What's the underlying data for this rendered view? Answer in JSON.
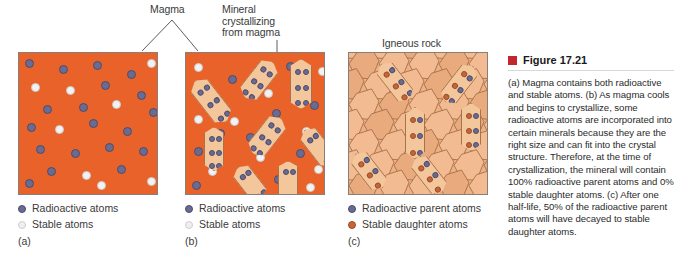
{
  "figure": {
    "marker_color": "#c1272d",
    "heading": "Figure 17.21",
    "caption": "(a) Magma contains both radioactive and stable atoms. (b) As magma cools and begins to crystallize, some radioactive atoms are incorporated into certain minerals because they are the right size and can fit into the crystal structure. Therefore, at the time of crystallization, the mineral will contain 100% radioactive parent atoms and 0% stable daughter atoms. (c) After one half-life, 50% of the radioactive parent atoms will have decayed to stable daughter atoms."
  },
  "callouts": {
    "magma": "Magma",
    "mineral": "Mineral\ncrystallizing\nfrom magma",
    "igneous": "Igneous rock"
  },
  "colors": {
    "magma_fill": "#e8622a",
    "rock_fill": "#efb184",
    "crystal_fill": "#f4c69c",
    "radioactive": "#6b6b8f",
    "stable": "#f2f2f2",
    "daughter": "#c4653a",
    "panel_border": "#8a7f78"
  },
  "panels": [
    {
      "id": "a",
      "tag": "(a)",
      "legend": [
        {
          "icon": "radioactive-atom-swatch",
          "label": "Radioactive atoms",
          "type": "radio"
        },
        {
          "icon": "stable-atom-swatch",
          "label": "Stable atoms",
          "type": "stable"
        }
      ],
      "atoms": [
        {
          "x": 6,
          "y": 6,
          "t": "radio"
        },
        {
          "x": 40,
          "y": 12,
          "t": "radio"
        },
        {
          "x": 74,
          "y": 8,
          "t": "radio"
        },
        {
          "x": 108,
          "y": 17,
          "t": "radio"
        },
        {
          "x": 128,
          "y": 6,
          "t": "stable"
        },
        {
          "x": 12,
          "y": 30,
          "t": "stable"
        },
        {
          "x": 47,
          "y": 33,
          "t": "stable"
        },
        {
          "x": 82,
          "y": 28,
          "t": "radio"
        },
        {
          "x": 118,
          "y": 38,
          "t": "radio"
        },
        {
          "x": 24,
          "y": 52,
          "t": "radio"
        },
        {
          "x": 60,
          "y": 50,
          "t": "radio"
        },
        {
          "x": 93,
          "y": 47,
          "t": "stable"
        },
        {
          "x": 130,
          "y": 55,
          "t": "radio"
        },
        {
          "x": 8,
          "y": 70,
          "t": "radio"
        },
        {
          "x": 36,
          "y": 72,
          "t": "stable"
        },
        {
          "x": 70,
          "y": 66,
          "t": "radio"
        },
        {
          "x": 104,
          "y": 74,
          "t": "radio"
        },
        {
          "x": 17,
          "y": 92,
          "t": "radio"
        },
        {
          "x": 52,
          "y": 96,
          "t": "radio"
        },
        {
          "x": 86,
          "y": 90,
          "t": "radio"
        },
        {
          "x": 120,
          "y": 94,
          "t": "radio"
        },
        {
          "x": 28,
          "y": 114,
          "t": "radio"
        },
        {
          "x": 63,
          "y": 118,
          "t": "stable"
        },
        {
          "x": 98,
          "y": 112,
          "t": "radio"
        },
        {
          "x": 128,
          "y": 124,
          "t": "stable"
        },
        {
          "x": 6,
          "y": 126,
          "t": "radio"
        },
        {
          "x": 78,
          "y": 128,
          "t": "stable"
        }
      ],
      "crystals": []
    },
    {
      "id": "b",
      "tag": "(b)",
      "legend": [
        {
          "icon": "radioactive-atom-swatch",
          "label": "Radioactive atoms",
          "type": "radio"
        },
        {
          "icon": "stable-atom-swatch",
          "label": "Stable atoms",
          "type": "stable"
        }
      ],
      "atoms": [
        {
          "x": 8,
          "y": 10,
          "t": "stable"
        },
        {
          "x": 42,
          "y": 22,
          "t": "radio"
        },
        {
          "x": 100,
          "y": 9,
          "t": "radio"
        },
        {
          "x": 132,
          "y": 14,
          "t": "stable"
        },
        {
          "x": 12,
          "y": 40,
          "t": "radio"
        },
        {
          "x": 78,
          "y": 36,
          "t": "stable"
        },
        {
          "x": 86,
          "y": 56,
          "t": "radio"
        },
        {
          "x": 124,
          "y": 48,
          "t": "radio"
        },
        {
          "x": 8,
          "y": 62,
          "t": "stable"
        },
        {
          "x": 44,
          "y": 64,
          "t": "stable"
        },
        {
          "x": 30,
          "y": 76,
          "t": "radio"
        },
        {
          "x": 60,
          "y": 80,
          "t": "radio"
        },
        {
          "x": 116,
          "y": 74,
          "t": "stable"
        },
        {
          "x": 8,
          "y": 94,
          "t": "radio"
        },
        {
          "x": 70,
          "y": 100,
          "t": "stable"
        },
        {
          "x": 110,
          "y": 96,
          "t": "radio"
        },
        {
          "x": 22,
          "y": 114,
          "t": "stable"
        },
        {
          "x": 50,
          "y": 118,
          "t": "radio"
        },
        {
          "x": 88,
          "y": 122,
          "t": "radio"
        },
        {
          "x": 128,
          "y": 112,
          "t": "stable"
        },
        {
          "x": 6,
          "y": 128,
          "t": "radio"
        },
        {
          "x": 120,
          "y": 130,
          "t": "stable"
        }
      ],
      "crystals": [
        {
          "x": 14,
          "y": 22,
          "w": 22,
          "h": 52,
          "rot": -38,
          "dots": 6
        },
        {
          "x": 62,
          "y": 4,
          "w": 22,
          "h": 46,
          "rot": 38,
          "dots": 6
        },
        {
          "x": 104,
          "y": 6,
          "w": 22,
          "h": 50,
          "rot": 0,
          "dots": 6
        },
        {
          "x": 70,
          "y": 60,
          "w": 22,
          "h": 46,
          "rot": 38,
          "dots": 6
        },
        {
          "x": 18,
          "y": 74,
          "w": 20,
          "h": 44,
          "rot": 0,
          "dots": 6
        },
        {
          "x": 122,
          "y": 72,
          "w": 20,
          "h": 44,
          "rot": -38,
          "dots": 4
        },
        {
          "x": 54,
          "y": 110,
          "w": 20,
          "h": 40,
          "rot": -38,
          "dots": 4
        },
        {
          "x": 92,
          "y": 108,
          "w": 20,
          "h": 40,
          "rot": 0,
          "dots": 4
        }
      ]
    },
    {
      "id": "c",
      "tag": "(c)",
      "legend": [
        {
          "icon": "radioactive-parent-atom-swatch",
          "label": "Radioactive parent atoms",
          "type": "radio"
        },
        {
          "icon": "stable-daughter-atom-swatch",
          "label": "Stable daughter atoms",
          "type": "daughter"
        }
      ],
      "atoms": [],
      "crystals": [
        {
          "x": 36,
          "y": 6,
          "w": 20,
          "h": 46,
          "rot": -38,
          "dots": 6,
          "mix": true
        },
        {
          "x": 100,
          "y": 8,
          "w": 20,
          "h": 46,
          "rot": 38,
          "dots": 6,
          "mix": true
        },
        {
          "x": 56,
          "y": 54,
          "w": 20,
          "h": 52,
          "rot": 0,
          "dots": 6,
          "mix": true
        },
        {
          "x": 112,
          "y": 50,
          "w": 20,
          "h": 48,
          "rot": 0,
          "dots": 6,
          "mix": true
        },
        {
          "x": 10,
          "y": 96,
          "w": 20,
          "h": 44,
          "rot": -38,
          "dots": 5,
          "mix": true
        },
        {
          "x": 70,
          "y": 100,
          "w": 20,
          "h": 44,
          "rot": -38,
          "dots": 5,
          "mix": true
        }
      ]
    }
  ]
}
